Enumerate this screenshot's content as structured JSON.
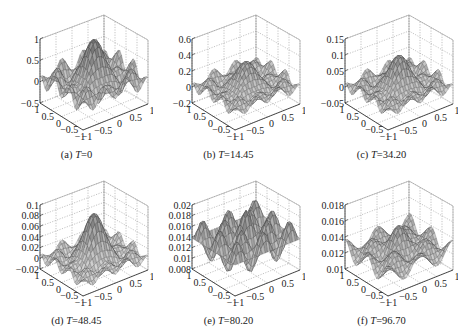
{
  "chart_data": [
    {
      "type": "surface",
      "label": "(a)",
      "var": "T",
      "value": "0",
      "zticks": [
        "1",
        "0.5",
        "0",
        "−0.5"
      ],
      "zlim": [
        -0.5,
        1
      ],
      "xticks": [
        "1",
        "0.5",
        "0",
        "−0.5",
        "−1"
      ],
      "yticks": [
        "−1",
        "−0.5",
        "0",
        "0.5",
        "1"
      ],
      "peak": 1.0,
      "amp": 0.35,
      "mode": "ripple",
      "shade": 0.55
    },
    {
      "type": "surface",
      "label": "(b)",
      "var": "T",
      "value": "14.45",
      "zticks": [
        "0.6",
        "0.4",
        "0.2",
        "0",
        "−0.2"
      ],
      "zlim": [
        -0.2,
        0.6
      ],
      "xticks": [
        "1",
        "0.5",
        "0",
        "−0.5",
        "−1"
      ],
      "yticks": [
        "−1",
        "−0.5",
        "0",
        "0.5",
        "1"
      ],
      "peak": 0.32,
      "amp": 0.12,
      "mode": "ripple",
      "shade": 0.55
    },
    {
      "type": "surface",
      "label": "(c)",
      "var": "T",
      "value": "34.20",
      "zticks": [
        "0.15",
        "0.1",
        "0.05",
        "0",
        "−0.05"
      ],
      "zlim": [
        -0.05,
        0.15
      ],
      "xticks": [
        "1",
        "0.5",
        "0",
        "−0.5",
        "−1"
      ],
      "yticks": [
        "−1",
        "−0.5",
        "0",
        "0.5",
        "1"
      ],
      "peak": 0.1,
      "amp": 0.03,
      "mode": "ripple",
      "shade": 0.55
    },
    {
      "type": "surface",
      "label": "(d)",
      "var": "T",
      "value": "48.45",
      "zticks": [
        "0.1",
        "0.08",
        "0.06",
        "0.04",
        "0.02",
        "0",
        "−0.02"
      ],
      "zlim": [
        -0.02,
        0.1
      ],
      "xticks": [
        "1",
        "0.5",
        "0",
        "−0.5",
        "−1"
      ],
      "yticks": [
        "−1",
        "−0.5",
        "0",
        "0.5",
        "1"
      ],
      "peak": 0.085,
      "amp": 0.018,
      "mode": "ripple",
      "shade": 0.55
    },
    {
      "type": "surface",
      "label": "(e)",
      "var": "T",
      "value": "80.20",
      "zticks": [
        "0.02",
        "0.018",
        "0.016",
        "0.014",
        "0.012",
        "0.01",
        "0.008"
      ],
      "zlim": [
        0.008,
        0.02
      ],
      "xticks": [
        "1",
        "0.5",
        "0",
        "−0.5",
        "−1"
      ],
      "yticks": [
        "−1",
        "−0.5",
        "0",
        "0.5",
        "1"
      ],
      "peak": 0.012,
      "amp": 0.006,
      "mode": "spikes",
      "shade": 0.55
    },
    {
      "type": "surface",
      "label": "(f)",
      "var": "T",
      "value": "96.70",
      "zticks": [
        "0.018",
        "0.016",
        "0.014",
        "0.012",
        "0.01"
      ],
      "zlim": [
        0.01,
        0.018
      ],
      "xticks": [
        "1",
        "0.5",
        "0",
        "−0.5",
        "−1"
      ],
      "yticks": [
        "−1",
        "−0.5",
        "0",
        "0.5",
        "1"
      ],
      "peak": 0.0152,
      "amp": 0.0018,
      "mode": "bowl",
      "shade": 0.55
    }
  ],
  "colors": {
    "mesh": "#2a2a2a",
    "surface_light": "#d8d8d8",
    "surface_dark": "#7a7a7a",
    "grid": "#9a9a9a",
    "axis": "#222222"
  }
}
